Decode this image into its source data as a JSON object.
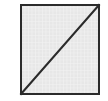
{
  "figure": {
    "title": "Square with diagonal",
    "description": "A square outlined with a dark border, filled with a fine light-gray grid hatch texture, crossed by a single dark diagonal line running from the bottom-left corner to the top-right corner.",
    "canvas": {
      "width": 108,
      "height": 101,
      "background_color": "#ffffff"
    },
    "shapes": {
      "square": {
        "name": "square",
        "x": 20,
        "y": 4,
        "width": 80,
        "height": 91,
        "border_color": "#2b2b2b",
        "border_width": 2,
        "fill_color": "#e7e7e7",
        "fill_pattern": "grid-hatch",
        "pattern_line_color": "#f4f4f4",
        "pattern_spacing": 3.5
      },
      "diagonal": {
        "name": "diagonal-line",
        "x1": 21,
        "y1": 94,
        "x2": 99,
        "y2": 5,
        "stroke_color": "#2b2b2b",
        "stroke_width": 2,
        "direction": "bottom-left-to-top-right"
      }
    }
  }
}
